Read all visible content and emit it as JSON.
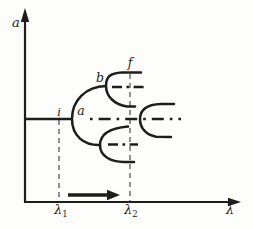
{
  "figure": {
    "kind": "period-doubling bifurcation diagram",
    "background": "#fdfdfb",
    "ink": "#1d1d1b",
    "guide_color": "#4a4a48"
  },
  "axes": {
    "y_label": "a",
    "x_label": "λ",
    "x_ticks": [
      {
        "base": "λ",
        "sub": "1"
      },
      {
        "base": "λ",
        "sub": "2"
      }
    ]
  },
  "points": {
    "i": "i",
    "a": "a",
    "b": "b",
    "f": "f"
  },
  "diagram": {
    "stable_branches": "solid curves (pitchfork cascade opening rightward)",
    "unstable_branches": "horizontal dash-dot lines through each bifurcation vertex",
    "guides": "vertical dashed lines at λ1 (first bifurcation) and λ2",
    "direction_arrow": "thick solid arrow pointing right between λ1 and λ2 above the x-axis"
  }
}
